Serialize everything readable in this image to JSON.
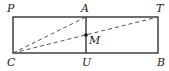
{
  "diagram": {
    "type": "geometry",
    "colors": {
      "stroke": "#222222",
      "dashed": "#555555",
      "background": "#ffffff"
    },
    "points": {
      "P": {
        "label": "P",
        "x": 13,
        "y": 17
      },
      "A": {
        "label": "A",
        "x": 86,
        "y": 17
      },
      "T": {
        "label": "T",
        "x": 158,
        "y": 17
      },
      "C": {
        "label": "C",
        "x": 13,
        "y": 53
      },
      "U": {
        "label": "U",
        "x": 86,
        "y": 53
      },
      "B": {
        "label": "B",
        "x": 158,
        "y": 53
      },
      "M": {
        "label": "M",
        "x": 86,
        "y": 35
      }
    },
    "segments": [
      {
        "from": "P",
        "to": "T",
        "style": "solid"
      },
      {
        "from": "T",
        "to": "B",
        "style": "solid"
      },
      {
        "from": "B",
        "to": "C",
        "style": "solid"
      },
      {
        "from": "C",
        "to": "P",
        "style": "solid"
      },
      {
        "from": "A",
        "to": "U",
        "style": "solid"
      },
      {
        "from": "C",
        "to": "A",
        "style": "dashed"
      },
      {
        "from": "C",
        "to": "T",
        "style": "dashed"
      }
    ]
  }
}
